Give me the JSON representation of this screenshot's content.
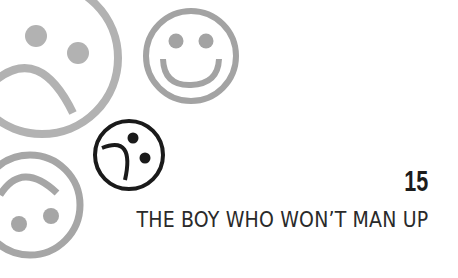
{
  "chapter": {
    "number": "15",
    "title": "THE BOY WHO WON’T MAN UP"
  },
  "illustration": {
    "faces": [
      {
        "name": "large-sad-face",
        "color": "#b2b2b2"
      },
      {
        "name": "smiley-face",
        "color": "#a3a3a3"
      },
      {
        "name": "tilted-confused-face",
        "color": "#1a1a1a"
      },
      {
        "name": "upside-down-smiley-face",
        "color": "#a6a6a6"
      }
    ]
  },
  "colors": {
    "background": "#ffffff",
    "text": "#1c1c1c"
  }
}
